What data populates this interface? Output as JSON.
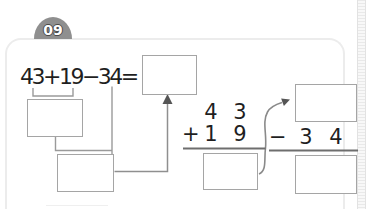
{
  "badge": {
    "number": "09"
  },
  "expression": {
    "text": "43+19−34="
  },
  "vertical_addition": {
    "operator": "+",
    "addend1": {
      "tens": "4",
      "ones": "3"
    },
    "addend2": {
      "tens": "1",
      "ones": "9"
    }
  },
  "vertical_subtraction": {
    "operator": "−",
    "subtrahend": {
      "tens": "3",
      "ones": "4"
    }
  },
  "answer_boxes": {
    "equals_result": "",
    "partial_sum": "",
    "partial_difference": "",
    "column_sum": "",
    "column_minuend": "",
    "column_difference": ""
  },
  "icons": {
    "up_arrow": "arrow-up-icon",
    "curved_arrow": "curved-arrow-icon"
  },
  "colors": {
    "badge_background": "#8f8f8f",
    "badge_text": "#ffffff",
    "line_gray": "#9a9a9a",
    "rule_dark": "#6e6e6e",
    "box_border": "#a5a5a5",
    "card_border": "#ececec",
    "digit_text": "#1f1f1f"
  }
}
